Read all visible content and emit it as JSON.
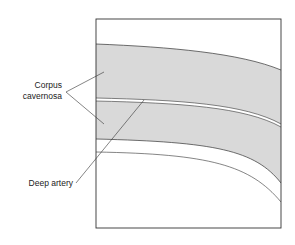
{
  "diagram": {
    "labels": {
      "corpus_line1": "Corpus",
      "corpus_line2": "cavernosa",
      "deep_artery": "Deep artery"
    },
    "colors": {
      "tissue_fill": "#d9d9d9",
      "outline": "#333333",
      "background": "#ffffff"
    }
  }
}
